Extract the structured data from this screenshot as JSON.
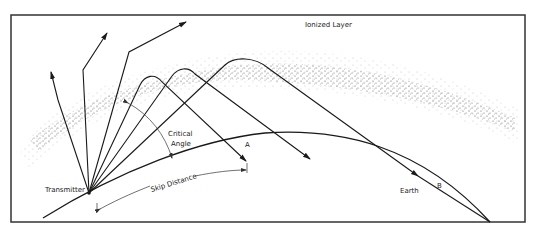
{
  "diagram": {
    "labels": {
      "ionized_layer": "Ionized Layer",
      "transmitter": "Transmitter",
      "critical_angle_line1": "Critical",
      "critical_angle_line2": "Angle",
      "skip_distance": "Skip Distance",
      "point_a": "A",
      "point_b": "B",
      "earth": "Earth"
    },
    "colors": {
      "line": "#1a1a1a",
      "frame": "#333333",
      "stipple": "#555555",
      "background": "#ffffff"
    }
  }
}
